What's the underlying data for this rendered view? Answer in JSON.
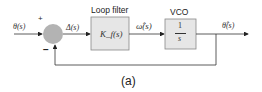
{
  "diagram": {
    "input_label": "θ(s)",
    "plus_sign": "+",
    "minus_sign": "−",
    "error_label": "Δ(s)",
    "loop_filter": {
      "title": "Loop filter",
      "tf": "K_f(s)"
    },
    "intermediate_label": "ω̂(s)",
    "vco": {
      "title": "VCO",
      "num": "1",
      "den": "s"
    },
    "output_label": "θ̂(s)",
    "caption": "(a)",
    "colors": {
      "block_fill": "#e6e6e6",
      "summer_fill": "#b3b3b3",
      "line": "#333333"
    }
  }
}
